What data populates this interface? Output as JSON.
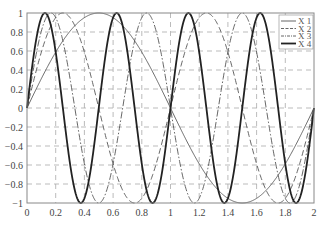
{
  "chart_data": {
    "type": "line",
    "title": "",
    "xlabel": "",
    "ylabel": "",
    "xlim": [
      0,
      2
    ],
    "ylim": [
      -1,
      1
    ],
    "grid": true,
    "legend_position": "top-right",
    "xticks": [
      "0",
      "0.2",
      "0.4",
      "0.6",
      "0.8",
      "1",
      "1.2",
      "1.4",
      "1.6",
      "1.8",
      "2"
    ],
    "xtick_values": [
      0,
      0.2,
      0.4,
      0.6,
      0.8,
      1,
      1.2,
      1.4,
      1.6,
      1.8,
      2
    ],
    "yticks": [
      "1",
      "0.8",
      "0.6",
      "0.4",
      "0.2",
      "0",
      "−0.2",
      "−0.4",
      "−0.6",
      "−0.8",
      "−1"
    ],
    "ytick_values": [
      1,
      0.8,
      0.6,
      0.4,
      0.2,
      0,
      -0.2,
      -0.4,
      -0.6,
      -0.8,
      -1
    ],
    "series": [
      {
        "name": "X 1",
        "function": "sin(pi*x)",
        "frequency": 1,
        "style": "solid-thin"
      },
      {
        "name": "X 2",
        "function": "sin(2*pi*x)",
        "frequency": 2,
        "style": "dashed"
      },
      {
        "name": "X 3",
        "function": "sin(3*pi*x)",
        "frequency": 3,
        "style": "dash-dot"
      },
      {
        "name": "X 4",
        "function": "sin(4*pi*x)",
        "frequency": 4,
        "style": "solid-thick"
      }
    ]
  }
}
